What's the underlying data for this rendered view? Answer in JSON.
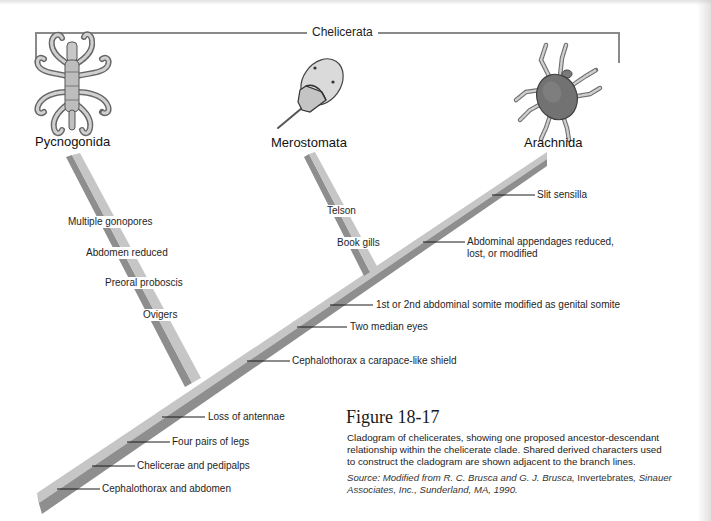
{
  "clade": {
    "title": "Chelicerata"
  },
  "taxa": [
    {
      "name": "Pycnogonida"
    },
    {
      "name": "Merostomata"
    },
    {
      "name": "Arachnida"
    }
  ],
  "branches": {
    "pycnogonida": {
      "characters": [
        "Multiple gonopores",
        "Abdomen reduced",
        "Preoral proboscis",
        "Ovigers"
      ]
    },
    "merostomata": {
      "characters": [
        "Telson",
        "Book gills"
      ]
    },
    "arachnida_trunk": {
      "characters": [
        "Slit sensilla",
        "Abdominal appendages reduced,",
        "lost, or modified"
      ]
    },
    "main_trunk": {
      "characters": [
        "1st or 2nd abdominal somite modified as genital somite",
        "Two median eyes",
        "Cephalothorax a carapace-like shield",
        "Loss of antennae",
        "Four pairs of legs",
        "Chelicerae and pedipalps",
        "Cephalothorax and abdomen"
      ]
    }
  },
  "caption": {
    "figure_label": "Figure 18-17",
    "lines": [
      "Cladogram of chelicerates, showing one proposed ancestor-descendant",
      "relationship within the chelicerate clade. Shared derived characters used",
      "to construct the cladogram are shown adjacent to the branch lines."
    ],
    "source": {
      "line1_part1": "Source: Modified from R. C. Brusca and G. J. Brusca, ",
      "line1_part2": "Invertebrates",
      "line1_part3": ", Sinauer",
      "line2": "Associates, Inc., Sunderland, MA, 1990."
    }
  },
  "colors": {
    "bar_light": "#c6c6c6",
    "bar_dark": "#8e8e8e",
    "bracket": "#8a8a8a",
    "tick": "#1a1a1a"
  }
}
